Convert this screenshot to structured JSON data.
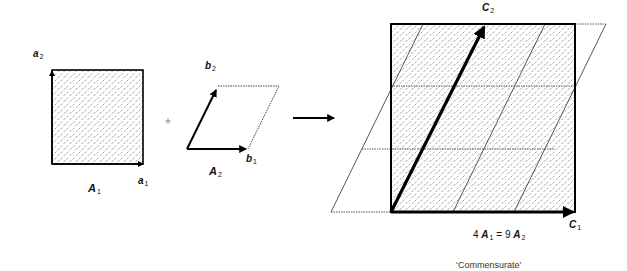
{
  "diagram": {
    "lattice_A1": {
      "name": "A",
      "sub": "1",
      "vectors": [
        {
          "name": "a",
          "sub": "1"
        },
        {
          "name": "a",
          "sub": "2"
        }
      ]
    },
    "operator_plus": "+",
    "lattice_A2": {
      "name": "A",
      "sub": "2",
      "vectors": [
        {
          "name": "b",
          "sub": "1"
        },
        {
          "name": "b",
          "sub": "2"
        }
      ]
    },
    "arrow": "→",
    "result": {
      "vectors": [
        {
          "name": "C",
          "sub": "1"
        },
        {
          "name": "C",
          "sub": "2"
        }
      ],
      "relation": {
        "left_coef": "4",
        "left_name": "A",
        "left_sub": "1",
        "equals": "=",
        "right_coef": "9",
        "right_name": "A",
        "right_sub": "2"
      },
      "caption": "‘Commensurate’"
    },
    "colors": {
      "stroke": "#000000",
      "hatch": "#555555",
      "background": "#ffffff"
    }
  }
}
